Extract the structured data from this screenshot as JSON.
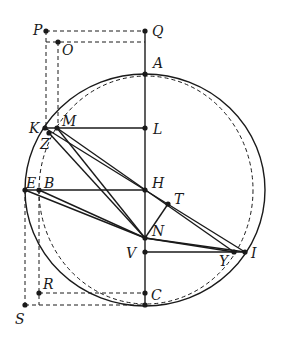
{
  "diagram": {
    "type": "geometric-construction",
    "stroke_color": "#1a1a1a",
    "background": "#ffffff",
    "circle": {
      "cx": 145,
      "cy": 190,
      "rx": 120,
      "ry": 116,
      "style": "solid"
    },
    "dashed_curve": {
      "cx": 146,
      "cy": 190,
      "rx": 107,
      "ry": 114,
      "style": "dashed"
    },
    "points": [
      {
        "name": "P",
        "x": 46,
        "y": 31,
        "lx": 33,
        "ly": 30
      },
      {
        "name": "Q",
        "x": 145,
        "y": 31,
        "lx": 152,
        "ly": 35
      },
      {
        "name": "O",
        "x": 58,
        "y": 42,
        "lx": 62,
        "ly": 54
      },
      {
        "name": "A",
        "x": 145,
        "y": 74,
        "lx": 153,
        "ly": 67
      },
      {
        "name": "K",
        "x": 45,
        "y": 128,
        "lx": 30,
        "ly": 133
      },
      {
        "name": "M",
        "x": 57,
        "y": 128,
        "lx": 62,
        "ly": 125
      },
      {
        "name": "Z",
        "x": 49,
        "y": 133,
        "lx": 40,
        "ly": 148
      },
      {
        "name": "L",
        "x": 145,
        "y": 128,
        "lx": 153,
        "ly": 133
      },
      {
        "name": "E",
        "x": 25,
        "y": 190,
        "lx": 27,
        "ly": 188
      },
      {
        "name": "B",
        "x": 39,
        "y": 190,
        "lx": 44,
        "ly": 188
      },
      {
        "name": "H",
        "x": 145,
        "y": 190,
        "lx": 152,
        "ly": 188
      },
      {
        "name": "T",
        "x": 168,
        "y": 204,
        "lx": 174,
        "ly": 203
      },
      {
        "name": "N",
        "x": 145,
        "y": 238,
        "lx": 152,
        "ly": 236
      },
      {
        "name": "V",
        "x": 145,
        "y": 252,
        "lx": 126,
        "ly": 258
      },
      {
        "name": "Y",
        "x": 234,
        "y": 252,
        "lx": 219,
        "ly": 266
      },
      {
        "name": "I",
        "x": 245,
        "y": 252,
        "lx": 252,
        "ly": 258
      },
      {
        "name": "R",
        "x": 39,
        "y": 293,
        "lx": 43,
        "ly": 289
      },
      {
        "name": "C",
        "x": 145,
        "y": 293,
        "lx": 152,
        "ly": 300
      },
      {
        "name": "Cb",
        "x": 145,
        "y": 305,
        "lx": null,
        "ly": null
      },
      {
        "name": "S",
        "x": 25,
        "y": 305,
        "lx": 16,
        "ly": 324
      }
    ],
    "solid_segments": [
      [
        145,
        31,
        145,
        305
      ],
      [
        45,
        128,
        145,
        128
      ],
      [
        25,
        190,
        145,
        190
      ],
      [
        145,
        252,
        245,
        252
      ],
      [
        45,
        128,
        245,
        252
      ],
      [
        57,
        128,
        234,
        252
      ],
      [
        57,
        128,
        145,
        238
      ],
      [
        49,
        133,
        145,
        238
      ],
      [
        25,
        190,
        145,
        238
      ],
      [
        39,
        190,
        145,
        238
      ],
      [
        145,
        238,
        245,
        252
      ],
      [
        145,
        238,
        234,
        252
      ],
      [
        168,
        204,
        145,
        238
      ]
    ],
    "dashed_segments": [
      [
        46,
        31,
        145,
        31
      ],
      [
        46,
        42,
        145,
        42
      ],
      [
        46,
        31,
        46,
        128
      ],
      [
        58,
        42,
        58,
        128
      ],
      [
        25,
        190,
        25,
        305
      ],
      [
        39,
        190,
        39,
        305
      ],
      [
        39,
        293,
        145,
        293
      ],
      [
        25,
        305,
        145,
        305
      ]
    ]
  },
  "labels": {
    "P": "P",
    "Q": "Q",
    "O": "O",
    "A": "A",
    "K": "K",
    "M": "M",
    "Z": "Z",
    "L": "L",
    "E": "E",
    "B": "B",
    "H": "H",
    "T": "T",
    "N": "N",
    "V": "V",
    "Y": "Y",
    "I": "I",
    "R": "R",
    "C": "C",
    "S": "S"
  }
}
